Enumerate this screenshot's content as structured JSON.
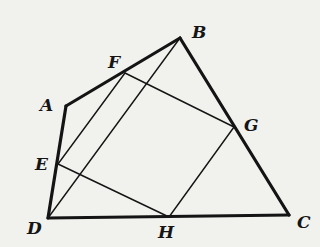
{
  "diagram": {
    "points": {
      "A": {
        "label": "A",
        "x": 66,
        "y": 106,
        "lx": 40,
        "ly": 111
      },
      "B": {
        "label": "B",
        "x": 180,
        "y": 38,
        "lx": 192,
        "ly": 38
      },
      "C": {
        "label": "C",
        "x": 289,
        "y": 215,
        "lx": 297,
        "ly": 228
      },
      "D": {
        "label": "D",
        "x": 48,
        "y": 218,
        "lx": 27,
        "ly": 234
      },
      "E": {
        "label": "E",
        "x": 58,
        "y": 164,
        "lx": 35,
        "ly": 170
      },
      "F": {
        "label": "F",
        "x": 125,
        "y": 73,
        "lx": 108,
        "ly": 68
      },
      "G": {
        "label": "G",
        "x": 234,
        "y": 127,
        "lx": 244,
        "ly": 131
      },
      "H": {
        "label": "H",
        "x": 169,
        "y": 217,
        "lx": 158,
        "ly": 238
      }
    },
    "thick_edges": [
      [
        "A",
        "B"
      ],
      [
        "B",
        "C"
      ],
      [
        "C",
        "D"
      ],
      [
        "D",
        "A"
      ]
    ],
    "thin_edges": [
      [
        "E",
        "F"
      ],
      [
        "F",
        "G"
      ],
      [
        "G",
        "H"
      ],
      [
        "H",
        "E"
      ],
      [
        "B",
        "D"
      ]
    ]
  }
}
